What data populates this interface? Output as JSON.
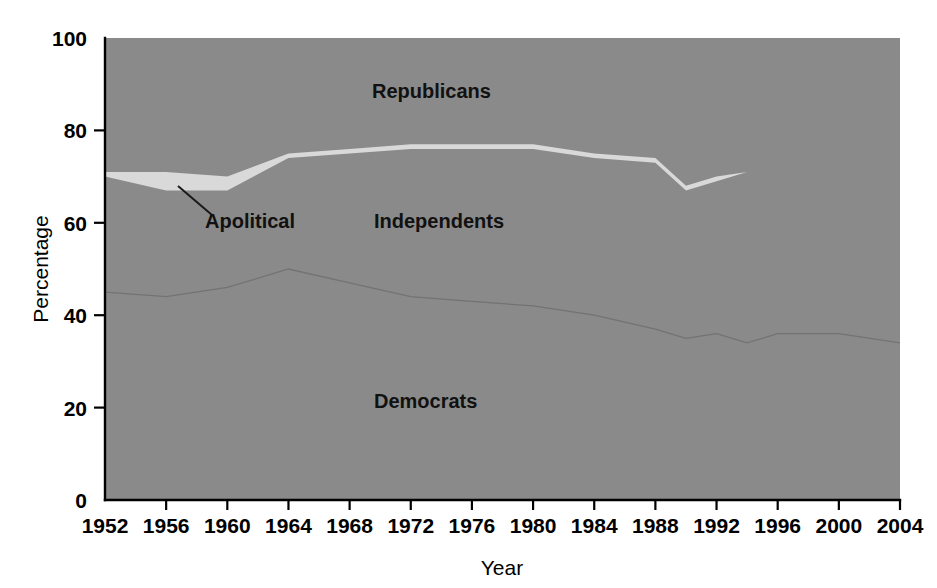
{
  "chart_data": {
    "type": "area",
    "title": "",
    "subtitle": "",
    "xlabel": "Year",
    "ylabel": "Percentage",
    "xlim": [
      1952,
      2004
    ],
    "ylim": [
      0,
      100
    ],
    "grid": false,
    "legend_position": "inline-annotations",
    "stacked": true,
    "stack_order_bottom_to_top": [
      "Democrats",
      "Independents",
      "Apolitical",
      "Republicans"
    ],
    "x": [
      1952,
      1956,
      1960,
      1964,
      1968,
      1972,
      1976,
      1980,
      1984,
      1988,
      1990,
      1992,
      1994,
      1996,
      2000,
      2004
    ],
    "xtick_labels": [
      "1952",
      "1956",
      "1960",
      "1964",
      "1968",
      "1972",
      "1976",
      "1980",
      "1984",
      "1988",
      "1992",
      "1996",
      "2000",
      "2004"
    ],
    "xtick_values": [
      1952,
      1956,
      1960,
      1964,
      1968,
      1972,
      1976,
      1980,
      1984,
      1988,
      1992,
      1996,
      2000,
      2004
    ],
    "ytick_labels": [
      "0",
      "20",
      "40",
      "60",
      "80",
      "100"
    ],
    "ytick_values": [
      0,
      20,
      40,
      60,
      80,
      100
    ],
    "cumulative_boundaries": {
      "democrats_top": [
        45,
        44,
        46,
        50,
        47,
        44,
        43,
        42,
        40,
        37,
        35,
        36,
        34,
        36,
        36,
        34
      ],
      "apolitical_bottom": [
        70,
        67,
        67,
        74,
        75,
        76,
        76,
        76,
        74,
        73,
        67,
        69,
        71,
        72,
        67,
        71
      ],
      "apolitical_top": [
        71,
        71,
        70,
        75,
        76,
        77,
        77,
        77,
        75,
        74,
        68,
        70,
        71,
        72,
        67,
        71
      ]
    },
    "series": [
      {
        "name": "Democrats",
        "values": [
          45,
          44,
          46,
          50,
          47,
          44,
          43,
          42,
          40,
          37,
          35,
          36,
          34,
          36,
          36,
          34
        ],
        "color": "#8a8a8a"
      },
      {
        "name": "Independents",
        "values": [
          25,
          23,
          21,
          24,
          28,
          32,
          33,
          34,
          34,
          36,
          32,
          33,
          37,
          36,
          31,
          37
        ],
        "color": "#8a8a8a"
      },
      {
        "name": "Apolitical",
        "values": [
          1,
          4,
          3,
          1,
          1,
          1,
          1,
          1,
          1,
          1,
          1,
          1,
          0,
          0,
          0,
          0
        ],
        "color": "#d8d8d8"
      },
      {
        "name": "Republicans",
        "values": [
          29,
          29,
          30,
          25,
          24,
          23,
          23,
          23,
          25,
          26,
          32,
          30,
          29,
          28,
          33,
          29
        ],
        "color": "#8a8a8a"
      }
    ],
    "annotations": [
      {
        "text": "Republicans",
        "x_px": 372,
        "y_px": 98,
        "leader": false
      },
      {
        "text": "Apolitical",
        "x_px": 205,
        "y_px": 228,
        "leader": true
      },
      {
        "text": "Independents",
        "x_px": 374,
        "y_px": 228,
        "leader": false
      },
      {
        "text": "Democrats",
        "x_px": 374,
        "y_px": 408,
        "leader": false
      }
    ]
  },
  "colors": {
    "plot_fill": "#8a8a8a",
    "apolitical_fill": "#d9d9d9",
    "axis": "#000000",
    "background": "#ffffff",
    "label_text": "#111111"
  },
  "axes": {
    "y_title": "Percentage",
    "x_title": "Year"
  }
}
